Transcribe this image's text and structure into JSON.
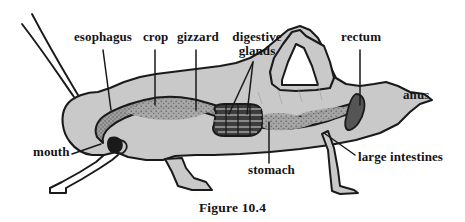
{
  "figure": {
    "caption": "Figure 10.4",
    "background_color": "#ffffff",
    "ink_color": "#1a1a1a",
    "body_fill_color": "#c9c9c9",
    "gut_fill_color": "#8e8e8e",
    "gland_fill_color": "#3a3a3a"
  },
  "labels": [
    {
      "id": "esophagus",
      "text": "esophagus",
      "x": 74,
      "y": 36
    },
    {
      "id": "crop",
      "text": "crop",
      "x": 143,
      "y": 36
    },
    {
      "id": "gizzard",
      "text": "gizzard",
      "x": 179,
      "y": 36
    },
    {
      "id": "digestive_glands",
      "line1": "digestive",
      "line2": "glands",
      "x": 228,
      "y": 36
    },
    {
      "id": "rectum",
      "text": "rectum",
      "x": 341,
      "y": 36
    },
    {
      "id": "anus",
      "text": "anus",
      "x": 403,
      "y": 94
    },
    {
      "id": "mouth",
      "text": "mouth",
      "x": 33,
      "y": 150
    },
    {
      "id": "stomach",
      "text": "stomach",
      "x": 250,
      "y": 168
    },
    {
      "id": "large_intestines",
      "text": "large intestines",
      "x": 358,
      "y": 158
    }
  ],
  "leader_lines": [
    {
      "id": "esophagus-leader",
      "from": [
        103,
        50
      ],
      "to": [
        110,
        108
      ]
    },
    {
      "id": "crop-leader",
      "from": [
        155,
        50
      ],
      "to": [
        155,
        104
      ]
    },
    {
      "id": "gizzard-leader",
      "from": [
        196,
        50
      ],
      "to": [
        196,
        108
      ]
    },
    {
      "id": "digestive-glands-leader-a",
      "from": [
        252,
        62
      ],
      "to": [
        228,
        112
      ]
    },
    {
      "id": "digestive-glands-leader-b",
      "from": [
        252,
        62
      ],
      "to": [
        246,
        113
      ]
    },
    {
      "id": "rectum-leader",
      "from": [
        360,
        50
      ],
      "to": [
        360,
        104
      ]
    },
    {
      "id": "mouth-leader",
      "from": [
        72,
        153
      ],
      "to": [
        100,
        143
      ]
    },
    {
      "id": "stomach-leader",
      "from": [
        269,
        164
      ],
      "to": [
        269,
        122
      ]
    },
    {
      "id": "large-intestines-leader",
      "from": [
        354,
        155
      ],
      "to": [
        323,
        133
      ]
    }
  ],
  "anatomy_parts": [
    {
      "id": "antenna-upper",
      "name": "antenna"
    },
    {
      "id": "antenna-lower",
      "name": "antenna"
    },
    {
      "id": "body-outline",
      "name": "grasshopper-body"
    },
    {
      "id": "hind-leg",
      "name": "hind-leg"
    },
    {
      "id": "middle-leg",
      "name": "middle-leg"
    },
    {
      "id": "front-leg",
      "name": "front-leg"
    },
    {
      "id": "eye",
      "name": "eye"
    },
    {
      "id": "gut-tube",
      "name": "digestive-tract"
    },
    {
      "id": "gastric-caeca",
      "name": "digestive-glands"
    },
    {
      "id": "rectum-shape",
      "name": "rectum"
    }
  ]
}
